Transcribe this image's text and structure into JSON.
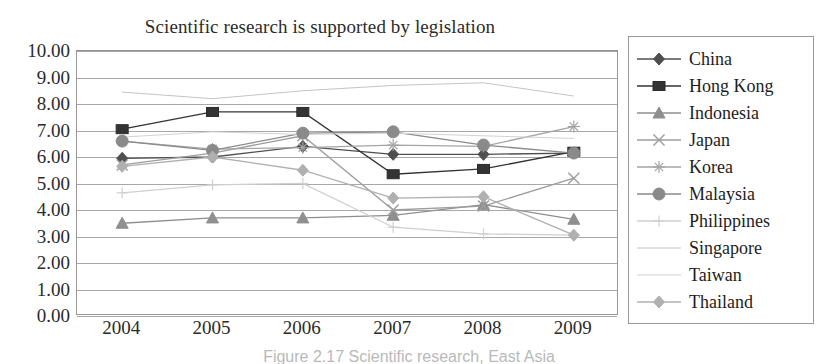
{
  "chart_data": {
    "type": "line",
    "title": "Scientific research is supported by legislation",
    "xlabel": "",
    "ylabel": "",
    "categories": [
      "2004",
      "2005",
      "2006",
      "2007",
      "2008",
      "2009"
    ],
    "ylim": [
      0,
      10
    ],
    "ytick_step": 1,
    "yticks": [
      "10.00",
      "9.00",
      "8.00",
      "7.00",
      "6.00",
      "5.00",
      "4.00",
      "3.00",
      "2.00",
      "1.00",
      "0.00"
    ],
    "grid": true,
    "legend_position": "right",
    "series": [
      {
        "name": "China",
        "marker": "diamond",
        "color": "#4f4f4f",
        "values": [
          5.95,
          6.0,
          6.4,
          6.1,
          6.1,
          6.15
        ]
      },
      {
        "name": "Hong Kong",
        "marker": "square",
        "color": "#333333",
        "values": [
          7.05,
          7.7,
          7.7,
          5.35,
          5.55,
          6.2
        ]
      },
      {
        "name": "Indonesia",
        "marker": "triangle",
        "color": "#8f8f8f",
        "values": [
          3.5,
          3.7,
          3.7,
          3.8,
          4.2,
          3.65
        ]
      },
      {
        "name": "Japan",
        "marker": "x",
        "color": "#9d9d9d",
        "values": [
          5.7,
          6.15,
          6.8,
          4.0,
          4.15,
          5.2
        ]
      },
      {
        "name": "Korea",
        "marker": "star",
        "color": "#a5a5a5",
        "values": [
          6.6,
          6.3,
          6.35,
          6.45,
          6.4,
          7.15
        ]
      },
      {
        "name": "Malaysia",
        "marker": "circle",
        "color": "#8a8a8a",
        "values": [
          6.6,
          6.25,
          6.9,
          6.95,
          6.45,
          6.15
        ]
      },
      {
        "name": "Philippines",
        "marker": "plus",
        "color": "#cfcfcf",
        "values": [
          4.65,
          4.95,
          5.0,
          3.35,
          3.1,
          3.05
        ]
      },
      {
        "name": "Singapore",
        "marker": "none",
        "color": "#c4c4c4",
        "values": [
          8.45,
          8.2,
          8.5,
          8.7,
          8.8,
          8.3
        ]
      },
      {
        "name": "Taiwan",
        "marker": "none",
        "color": "#d2d2d2",
        "values": [
          6.75,
          6.95,
          6.85,
          6.9,
          6.8,
          6.7
        ]
      },
      {
        "name": "Thailand",
        "marker": "diamond",
        "color": "#b0b0b0",
        "values": [
          5.65,
          6.0,
          5.5,
          4.45,
          4.5,
          3.05
        ]
      }
    ]
  },
  "caption": {
    "text": "Figure 2.17   Scientific research, East Asia"
  },
  "legend": {
    "items": [
      {
        "label": "China"
      },
      {
        "label": "Hong Kong"
      },
      {
        "label": "Indonesia"
      },
      {
        "label": "Japan"
      },
      {
        "label": "Korea"
      },
      {
        "label": "Malaysia"
      },
      {
        "label": "Philippines"
      },
      {
        "label": "Singapore"
      },
      {
        "label": "Taiwan"
      },
      {
        "label": "Thailand"
      }
    ]
  }
}
